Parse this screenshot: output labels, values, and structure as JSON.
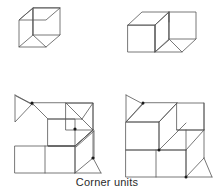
{
  "figure": {
    "caption": "Corner units",
    "line_color": "#555555",
    "accent_color": "#1a1a1a",
    "background_color": "#ffffff",
    "stroke_width": 0.8,
    "panels": [
      {
        "name": "single-cube",
        "label": "single cube unit",
        "position": "top-left",
        "cube_count": 1
      },
      {
        "name": "double-cube",
        "label": "two cube units",
        "position": "top-right",
        "cube_count": 2
      },
      {
        "name": "stepped-corner-assembly",
        "label": "stepped corner assembly",
        "position": "bottom-left",
        "cube_count": 5
      },
      {
        "name": "stacked-corner-assembly",
        "label": "stacked corner assembly",
        "position": "bottom-right",
        "cube_count": 5
      }
    ]
  }
}
